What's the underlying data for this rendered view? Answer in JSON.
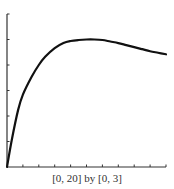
{
  "caption": "[0,  20] by [0,  3]",
  "chart_data": {
    "type": "line",
    "title": "",
    "xlabel": "",
    "ylabel": "",
    "xlim": [
      0,
      20
    ],
    "ylim": [
      0,
      3
    ],
    "x_tick_step": 2,
    "y_tick_step": 0.5,
    "grid": false,
    "tick_labels": false,
    "window_label": "[0, 20] by [0, 3]",
    "series": [
      {
        "name": "curve",
        "x": [
          0,
          0.6,
          1.4,
          2,
          3.1,
          4,
          4.8,
          6,
          7.1,
          8,
          9,
          10,
          11,
          12,
          13,
          14,
          15,
          16,
          17,
          18,
          19,
          20
        ],
        "y": [
          0,
          0.53,
          1.12,
          1.42,
          1.77,
          2.0,
          2.16,
          2.33,
          2.43,
          2.47,
          2.49,
          2.5,
          2.5,
          2.49,
          2.46,
          2.43,
          2.39,
          2.35,
          2.31,
          2.27,
          2.24,
          2.21
        ]
      }
    ]
  }
}
